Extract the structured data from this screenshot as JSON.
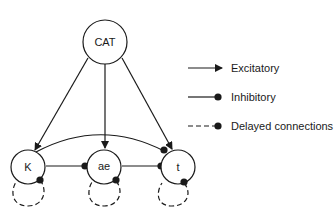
{
  "diagram": {
    "nodes": [
      {
        "id": "CAT",
        "label": "CAT"
      },
      {
        "id": "K",
        "label": "K"
      },
      {
        "id": "ae",
        "label": "ae"
      },
      {
        "id": "t",
        "label": "t"
      }
    ],
    "edges": [
      {
        "from": "CAT",
        "to": "K",
        "type": "excitatory"
      },
      {
        "from": "CAT",
        "to": "ae",
        "type": "excitatory"
      },
      {
        "from": "CAT",
        "to": "t",
        "type": "excitatory"
      },
      {
        "from": "K",
        "to": "ae",
        "type": "inhibitory"
      },
      {
        "from": "ae",
        "to": "t",
        "type": "inhibitory"
      },
      {
        "from": "K",
        "to": "t",
        "type": "inhibitory"
      },
      {
        "from": "K",
        "to": "K",
        "type": "delayed"
      },
      {
        "from": "ae",
        "to": "ae",
        "type": "delayed"
      },
      {
        "from": "t",
        "to": "t",
        "type": "delayed"
      }
    ]
  },
  "legend": {
    "items": [
      {
        "label": "Excitatory",
        "style": "arrow"
      },
      {
        "label": "Inhibitory",
        "style": "dot"
      },
      {
        "label": "Delayed connections",
        "style": "dashed-dot"
      }
    ]
  },
  "colors": {
    "stroke": "#1a1a1a",
    "background": "#ffffff"
  }
}
